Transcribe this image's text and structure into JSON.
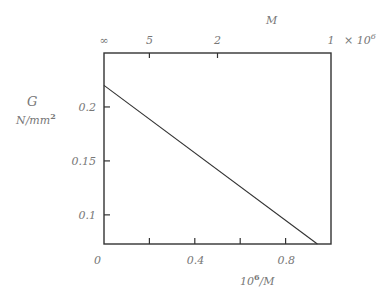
{
  "chart_data": {
    "type": "line",
    "title": "",
    "xlabel": "10^6/M",
    "xlabel_base": "10",
    "xlabel_exp": "6",
    "xlabel_rest": "/M",
    "ylabel_line1": "G",
    "ylabel_line2": "N/mm",
    "ylabel_exp": "2",
    "top_axis_label": "M",
    "top_axis_multiplier": "× 10",
    "top_axis_multiplier_exp": "6",
    "xlim": [
      0,
      1.0
    ],
    "ylim": [
      0.073,
      0.25
    ],
    "x_ticks": [
      0,
      0.2,
      0.4,
      0.6,
      0.8
    ],
    "x_tick_labels": [
      "0",
      "",
      "0.4",
      "",
      "0.8"
    ],
    "y_ticks": [
      0.1,
      0.15,
      0.2
    ],
    "y_tick_labels": [
      "0.1",
      "0.15",
      "0.2"
    ],
    "top_ticks": [
      {
        "pos": 0,
        "label": "∞"
      },
      {
        "pos": 0.2,
        "label": "5"
      },
      {
        "pos": 0.5,
        "label": "2"
      },
      {
        "pos": 1.0,
        "label": "1"
      }
    ],
    "grid": false,
    "legend": null,
    "series": [
      {
        "name": "G vs 10^6/M",
        "x": [
          0,
          0.94
        ],
        "y": [
          0.22,
          0.073
        ]
      }
    ]
  }
}
